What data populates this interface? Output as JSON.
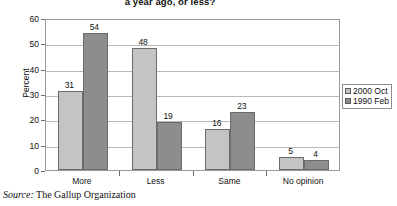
{
  "chart_data": {
    "type": "bar",
    "title": "a year ago, or less?",
    "xlabel": "",
    "ylabel": "Percent",
    "ylim": [
      0,
      60
    ],
    "yticks": [
      0,
      10,
      20,
      30,
      40,
      50,
      60
    ],
    "grid": true,
    "legend_position": "right",
    "categories": [
      "More",
      "Less",
      "Same",
      "No opinion"
    ],
    "series": [
      {
        "name": "2000 Oct",
        "color": "#c4c4c4",
        "values": [
          31,
          48,
          16,
          5
        ]
      },
      {
        "name": "1990 Feb",
        "color": "#8d8d8d",
        "values": [
          54,
          19,
          23,
          4
        ]
      }
    ]
  },
  "source": {
    "label": "Source:",
    "text": "The Gallup Organization"
  }
}
